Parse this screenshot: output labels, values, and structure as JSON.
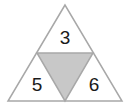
{
  "diagram": {
    "type": "triangle-number-puzzle",
    "colors": {
      "stroke": "#a8a8a8",
      "center_fill": "#c8c8c8",
      "outer_fill": "#ffffff",
      "text": "#1a1a1a"
    },
    "cells": {
      "top": "3",
      "left": "5",
      "right": "6",
      "center": ""
    }
  }
}
